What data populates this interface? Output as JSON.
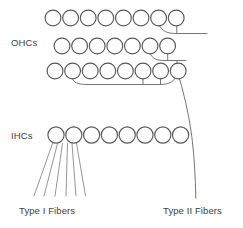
{
  "figure": {
    "type": "anatomical-schematic",
    "background_color": "#ffffff",
    "stroke_color": "#58585a",
    "fiber_color": "#6d6e71",
    "text_color": "#414042"
  },
  "labels": {
    "ohcs": "OHCs",
    "ihcs": "IHCs",
    "type_i_fibers": "Type I Fibers",
    "type_ii_fibers": "Type II Fibers"
  },
  "hair_cells": {
    "ohc_rows": [
      {
        "row_name": "ohc-row-1",
        "count": 8,
        "start_x": 53,
        "center_y": 18,
        "spacing": 17.6,
        "radius": 7.9
      },
      {
        "row_name": "ohc-row-2",
        "count": 7,
        "start_x": 62,
        "center_y": 46,
        "spacing": 17.6,
        "radius": 7.9
      },
      {
        "row_name": "ohc-row-3",
        "count": 8,
        "start_x": 55,
        "center_y": 71,
        "spacing": 17.6,
        "radius": 7.9
      }
    ],
    "ihc_row": {
      "row_name": "ihc-row-1",
      "count": 8,
      "start_x": 56,
      "center_y": 135,
      "spacing": 17.8,
      "radius": 8.1
    }
  },
  "fibers": {
    "type_i": {
      "count": 6,
      "origin_y": 144,
      "terminus_y": 196,
      "origin_xs": [
        52,
        57,
        62,
        67,
        72,
        77
      ],
      "terminus_xs": [
        34,
        44,
        55,
        66,
        76,
        85
      ]
    },
    "type_ii": {
      "description": "Descending afferent trunk from outer hair cell rows",
      "top_x": 178,
      "bottom_x": 196,
      "top_y": 72,
      "bottom_y": 198
    }
  },
  "icon_names": {
    "hair_cell": "circle-hair-cell-icon",
    "fiber": "nerve-fiber-icon",
    "trunk": "nerve-trunk-icon"
  }
}
